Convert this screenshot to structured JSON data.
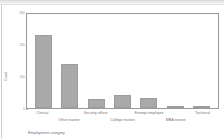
{
  "window": {
    "titlebar_name": "window-titlebar"
  },
  "chart_data": {
    "type": "bar",
    "title": "",
    "subtitle": "",
    "xlabel": "Employment category",
    "ylabel": "Count",
    "categories": [
      "Clerical",
      "Office trainee",
      "Security officer",
      "College trainee",
      "Exempt employee",
      "MBA trainee",
      "Technical"
    ],
    "values": [
      227,
      136,
      27,
      41,
      32,
      5,
      3
    ],
    "ylim": [
      0,
      300
    ],
    "yticks": [
      0,
      100,
      200,
      300
    ],
    "ytick_labels": [
      "0",
      "100",
      "200",
      "300"
    ],
    "grid": false,
    "legend": null,
    "bar_color": "#a9a9a9",
    "bar_edge_color": "#9d9d9d",
    "axis_color": "#9a9a9a",
    "label_color": "#6f6f6f",
    "label_rows": [
      0,
      1,
      0,
      1,
      0,
      1,
      0
    ]
  }
}
